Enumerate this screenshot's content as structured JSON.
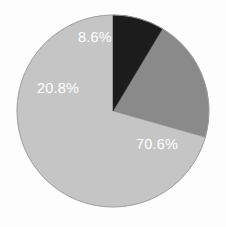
{
  "chart_data": {
    "type": "pie",
    "title": "",
    "subtitle": "",
    "xlabel": "",
    "ylabel": "",
    "grid": false,
    "legend_position": "none",
    "start_angle_deg": 90,
    "direction": "counterclockwise",
    "categories": [
      "Segment 1",
      "Segment 2",
      "Segment 3"
    ],
    "values": [
      70.6,
      20.8,
      8.6
    ],
    "labels": [
      "70.6%",
      "20.8%",
      "8.6%"
    ],
    "slices": [
      {
        "label": "70.6%",
        "value": 70.6,
        "color": "#c5c5c5",
        "label_color": "#ffffff",
        "label_x": 157,
        "label_y": 145
      },
      {
        "label": "20.8%",
        "value": 20.8,
        "color": "#8a8a8a",
        "label_color": "#ffffff",
        "label_x": 58,
        "label_y": 89
      },
      {
        "label": "8.6%",
        "value": 8.6,
        "color": "#1c1c1c",
        "label_color": "#ffffff",
        "label_x": 95,
        "label_y": 38
      }
    ]
  },
  "geometry": {
    "center_x": 113,
    "center_y": 111,
    "radius": 96,
    "outline_color": "#9a9a9a",
    "outline_width": 0.9
  },
  "canvas": {
    "width": 226,
    "height": 227,
    "background": "#fdfdfd"
  }
}
